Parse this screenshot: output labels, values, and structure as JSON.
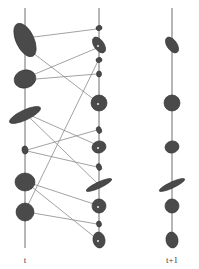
{
  "diagram": {
    "type": "gaussian-correspondence",
    "labels": {
      "left_axis": "t",
      "right_axis": "t+1"
    },
    "colors": {
      "axis": "#6f6f6f",
      "link": "#8a8a8a",
      "blob_fill": "#4a4a4a"
    },
    "axes": [
      {
        "name": "t",
        "x": 25,
        "y1": 8,
        "y2": 248
      },
      {
        "name": "middle",
        "x": 99,
        "y1": 8,
        "y2": 248
      },
      {
        "name": "t+1",
        "x": 172,
        "y1": 8,
        "y2": 248
      }
    ],
    "left_blobs": [
      {
        "cx": 25,
        "cy": 40,
        "rx": 9,
        "ry": 18,
        "rot": -25
      },
      {
        "cx": 25,
        "cy": 79,
        "rx": 11,
        "ry": 9,
        "rot": -15
      },
      {
        "cx": 25,
        "cy": 115,
        "rx": 17,
        "ry": 5,
        "rot": -25
      },
      {
        "cx": 25,
        "cy": 150,
        "rx": 3,
        "ry": 4,
        "rot": -10
      },
      {
        "cx": 25,
        "cy": 182,
        "rx": 10,
        "ry": 9,
        "rot": 0
      },
      {
        "cx": 25,
        "cy": 212,
        "rx": 9,
        "ry": 9,
        "rot": 0
      }
    ],
    "middle_blobs": [
      {
        "cx": 99,
        "cy": 28,
        "rx": 3,
        "ry": 2.5,
        "rot": -20
      },
      {
        "cx": 99,
        "cy": 45,
        "rx": 5,
        "ry": 9,
        "rot": -35
      },
      {
        "cx": 99,
        "cy": 60,
        "rx": 3,
        "ry": 2.5,
        "rot": -20
      },
      {
        "cx": 99,
        "cy": 74,
        "rx": 2.5,
        "ry": 3,
        "rot": 0
      },
      {
        "cx": 99,
        "cy": 103,
        "rx": 8,
        "ry": 8,
        "rot": 0
      },
      {
        "cx": 99,
        "cy": 130,
        "rx": 2.5,
        "ry": 3.5,
        "rot": -20
      },
      {
        "cx": 99,
        "cy": 147,
        "rx": 7,
        "ry": 6,
        "rot": -15
      },
      {
        "cx": 99,
        "cy": 167,
        "rx": 2.5,
        "ry": 3.5,
        "rot": -20
      },
      {
        "cx": 99,
        "cy": 185,
        "rx": 14,
        "ry": 3,
        "rot": -25
      },
      {
        "cx": 99,
        "cy": 206,
        "rx": 7,
        "ry": 7,
        "rot": -10
      },
      {
        "cx": 99,
        "cy": 224,
        "rx": 2.5,
        "ry": 3,
        "rot": -10
      },
      {
        "cx": 99,
        "cy": 240,
        "rx": 6,
        "ry": 8,
        "rot": -10
      }
    ],
    "right_blobs": [
      {
        "cx": 172,
        "cy": 45,
        "rx": 5,
        "ry": 9,
        "rot": -35
      },
      {
        "cx": 172,
        "cy": 103,
        "rx": 8,
        "ry": 8,
        "rot": 0
      },
      {
        "cx": 172,
        "cy": 147,
        "rx": 7,
        "ry": 6,
        "rot": -15
      },
      {
        "cx": 172,
        "cy": 185,
        "rx": 14,
        "ry": 3,
        "rot": -25
      },
      {
        "cx": 172,
        "cy": 206,
        "rx": 7,
        "ry": 7,
        "rot": -10
      },
      {
        "cx": 172,
        "cy": 240,
        "rx": 6,
        "ry": 8,
        "rot": -10
      }
    ],
    "links": [
      {
        "x1": 34,
        "y1": 37,
        "x2": 97,
        "y2": 29
      },
      {
        "x1": 33,
        "y1": 53,
        "x2": 96,
        "y2": 101
      },
      {
        "x1": 35,
        "y1": 74,
        "x2": 97,
        "y2": 48
      },
      {
        "x1": 36,
        "y1": 79,
        "x2": 97,
        "y2": 74
      },
      {
        "x1": 98,
        "y1": 61,
        "x2": 28,
        "y2": 205
      },
      {
        "x1": 32,
        "y1": 116,
        "x2": 97,
        "y2": 145
      },
      {
        "x1": 30,
        "y1": 118,
        "x2": 97,
        "y2": 183
      },
      {
        "x1": 27,
        "y1": 150,
        "x2": 97,
        "y2": 130
      },
      {
        "x1": 27,
        "y1": 151,
        "x2": 97,
        "y2": 167
      },
      {
        "x1": 33,
        "y1": 184,
        "x2": 97,
        "y2": 205
      },
      {
        "x1": 32,
        "y1": 187,
        "x2": 97,
        "y2": 239
      },
      {
        "x1": 33,
        "y1": 213,
        "x2": 97,
        "y2": 224
      }
    ]
  }
}
